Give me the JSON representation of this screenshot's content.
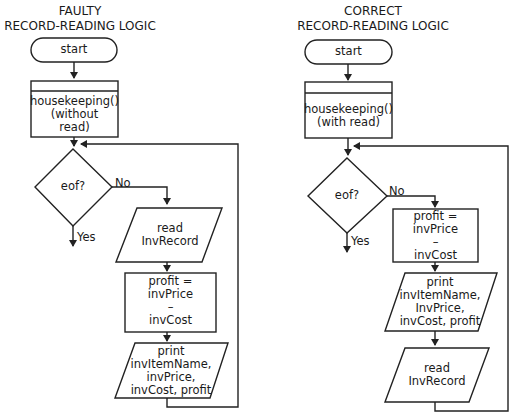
{
  "faulty": {
    "title_line1": "FAULTY",
    "title_line2": "RECORD-READING LOGIC",
    "start": "start",
    "housekeeping": "housekeeping()\n(without\nread)",
    "decision": "eof?",
    "no_label": "No",
    "yes_label": "Yes",
    "steps": [
      {
        "type": "io",
        "text": "read\nInvRecord"
      },
      {
        "type": "process",
        "text": "profit =\ninvPrice\n–\ninvCost"
      },
      {
        "type": "io",
        "text": "print\ninvItemName,\ninvPrice,\ninvCost, profit"
      }
    ]
  },
  "correct": {
    "title_line1": "CORRECT",
    "title_line2": "RECORD-READING LOGIC",
    "start": "start",
    "housekeeping": "housekeeping()\n(with read)",
    "decision": "eof?",
    "no_label": "No",
    "yes_label": "Yes",
    "steps": [
      {
        "type": "process",
        "text": "profit =\ninvPrice\n–\ninvCost"
      },
      {
        "type": "io",
        "text": "print\ninvItemName,\nInvPrice,\ninvCost, profit"
      },
      {
        "type": "io",
        "text": "read\nInvRecord"
      }
    ]
  }
}
